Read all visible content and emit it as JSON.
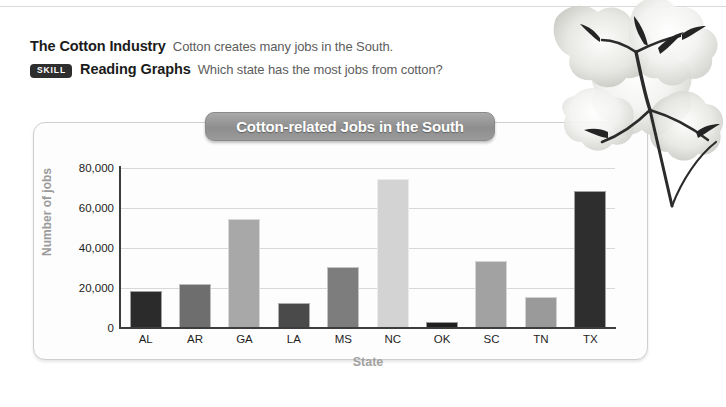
{
  "heading": {
    "line1_bold": "The Cotton Industry",
    "line1_text": "Cotton creates many jobs in the South.",
    "badge": "SKILL",
    "line2_bold": "Reading Graphs",
    "line2_text": "Which state has the most jobs from cotton?"
  },
  "chart_data": {
    "type": "bar",
    "title": "Cotton-related Jobs in the South",
    "xlabel": "State",
    "ylabel": "Number of jobs",
    "categories": [
      "AL",
      "AR",
      "GA",
      "LA",
      "MS",
      "NC",
      "OK",
      "SC",
      "TN",
      "TX"
    ],
    "values": [
      18000,
      21500,
      54000,
      12000,
      30000,
      74000,
      2500,
      33000,
      15000,
      68000
    ],
    "bar_colors": [
      "#2b2b2b",
      "#6e6e6e",
      "#a8a8a8",
      "#4a4a4a",
      "#7d7d7d",
      "#d3d3d3",
      "#1f1f1f",
      "#a2a2a2",
      "#9a9a9a",
      "#2e2e2e"
    ],
    "ylim": [
      0,
      80000
    ],
    "ytick_values": [
      0,
      20000,
      40000,
      60000,
      80000
    ],
    "ytick_labels": [
      "0",
      "20,000",
      "40,000",
      "60,000",
      "80,000"
    ],
    "grid": true,
    "legend": "none"
  },
  "colors": {
    "title_pill": "#9a9a9a",
    "axis": "#3d3d3d",
    "gridline": "#d8d8d8",
    "axis_title": "#9b9b9b",
    "badge_bg": "#2e2e2e"
  },
  "icons": {
    "cotton_plant": "cotton-plant-photo"
  }
}
